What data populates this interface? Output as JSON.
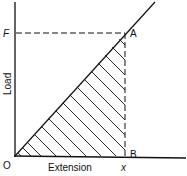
{
  "diagram": {
    "type": "load-extension graph",
    "y_axis_label": "Load",
    "x_axis_label": "Extension",
    "origin_label": "O",
    "load_value_label": "F",
    "extension_value_label": "x",
    "point_a_label": "A",
    "point_b_label": "B",
    "shaded_region": "triangle OAB (hatched)"
  }
}
